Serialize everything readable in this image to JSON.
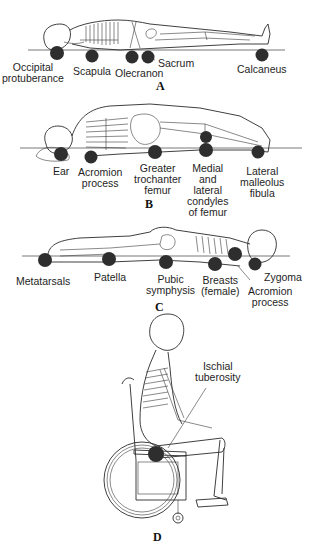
{
  "figure": {
    "colors": {
      "pressure_dot": "#2e2e2e",
      "line_art": "#2a2a2a",
      "background": "#ffffff"
    }
  },
  "panels": [
    {
      "letter": "A",
      "position": "supine",
      "labels": [
        {
          "text_lines": [
            "Occipital",
            "protuberance"
          ]
        },
        {
          "text_lines": [
            "Scapula"
          ]
        },
        {
          "text_lines": [
            "Olecranon"
          ]
        },
        {
          "text_lines": [
            "Sacrum"
          ]
        },
        {
          "text_lines": [
            "Calcaneus"
          ]
        }
      ]
    },
    {
      "letter": "B",
      "position": "lateral",
      "labels": [
        {
          "text_lines": [
            "Ear"
          ]
        },
        {
          "text_lines": [
            "Acromion",
            "process"
          ]
        },
        {
          "text_lines": [
            "Greater",
            "trochanter",
            "femur"
          ]
        },
        {
          "text_lines": [
            "Medial",
            "and",
            "lateral",
            "condyles",
            "of femur"
          ]
        },
        {
          "text_lines": [
            "Lateral",
            "malleolus",
            "fibula"
          ]
        }
      ]
    },
    {
      "letter": "C",
      "position": "prone",
      "labels": [
        {
          "text_lines": [
            "Metatarsals"
          ]
        },
        {
          "text_lines": [
            "Patella"
          ]
        },
        {
          "text_lines": [
            "Pubic",
            "symphysis"
          ]
        },
        {
          "text_lines": [
            "Breasts",
            "(female)"
          ]
        },
        {
          "text_lines": [
            "Zygoma"
          ]
        },
        {
          "text_lines": [
            "Acromion",
            "process"
          ]
        }
      ]
    },
    {
      "letter": "D",
      "position": "seated in wheelchair",
      "labels": [
        {
          "text_lines": [
            "Ischial",
            "tuberosity"
          ]
        }
      ]
    }
  ]
}
